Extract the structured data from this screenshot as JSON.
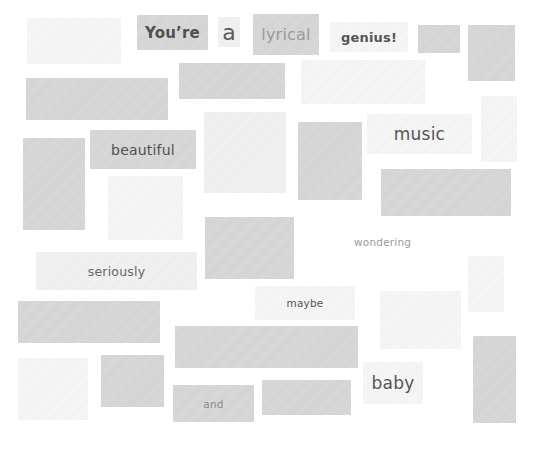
{
  "canvas": {
    "width": 536,
    "height": 449,
    "background": "#ffffff"
  },
  "colors": {
    "block_dark": "#d6d6d6",
    "block_mid": "#dedede",
    "block_pale": "#f1f1f1",
    "block_faint": "#f6f6f6",
    "text_dark": "#555555",
    "text_light": "#9a9a9a"
  },
  "words": {
    "youre": "You’re",
    "a": "a",
    "lyrical": "lyrical",
    "genius": "genius!",
    "beautiful": "beautiful",
    "music": "music",
    "wondering": "wondering",
    "seriously": "seriously",
    "maybe": "maybe",
    "and": "and",
    "baby": "baby"
  }
}
